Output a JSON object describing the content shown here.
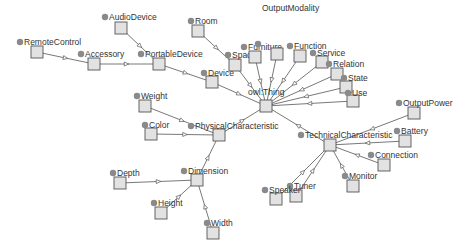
{
  "diagram": {
    "type": "class-hierarchy-graph",
    "colors": {
      "box_fill": "#e2e2e2",
      "box_stroke": "#555555",
      "dot": "#8a8a8a",
      "edge": "#555555",
      "label": "#333333"
    },
    "nodes": [
      {
        "id": "owlThing",
        "label": "owl:Thing",
        "x": 266,
        "y": 106,
        "lx": 248,
        "ly": 95,
        "dot": false
      },
      {
        "id": "RemoteControl",
        "label": "RemoteControl",
        "x": 37,
        "y": 52,
        "lx": 24,
        "ly": 45,
        "dot": true
      },
      {
        "id": "Accessory",
        "label": "Accessory",
        "x": 94,
        "y": 64,
        "lx": 85,
        "ly": 57,
        "dot": true
      },
      {
        "id": "AudioDevice",
        "label": "AudioDevice",
        "x": 121,
        "y": 28,
        "lx": 109,
        "ly": 20,
        "dot": true
      },
      {
        "id": "PortableDevice",
        "label": "PortableDevice",
        "x": 159,
        "y": 64,
        "lx": 145,
        "ly": 57,
        "dot": true
      },
      {
        "id": "Room",
        "label": "Room",
        "x": 198,
        "y": 31,
        "lx": 195,
        "ly": 24,
        "dot": true
      },
      {
        "id": "Device",
        "label": "Device",
        "x": 212,
        "y": 82,
        "lx": 208,
        "ly": 76,
        "dot": true
      },
      {
        "id": "Space",
        "label": "Space",
        "x": 235,
        "y": 65,
        "lx": 232,
        "ly": 58,
        "dot": true
      },
      {
        "id": "Furniture",
        "label": "Furniture",
        "x": 255,
        "y": 57,
        "lx": 248,
        "ly": 50,
        "dot": true
      },
      {
        "id": "OutputModality",
        "label": "OutputModality",
        "x": 277,
        "y": 54,
        "lx": 262,
        "ly": 11,
        "dot": true,
        "dx": 258,
        "dy": 44
      },
      {
        "id": "Function",
        "label": "Function",
        "x": 300,
        "y": 56,
        "lx": 294,
        "ly": 49,
        "dot": true
      },
      {
        "id": "Service",
        "label": "Service",
        "x": 322,
        "y": 62,
        "lx": 317,
        "ly": 56,
        "dot": true
      },
      {
        "id": "Relation",
        "label": "Relation",
        "x": 337,
        "y": 74,
        "lx": 333,
        "ly": 67,
        "dot": true
      },
      {
        "id": "State",
        "label": "State",
        "x": 346,
        "y": 87,
        "lx": 348,
        "ly": 81,
        "dot": true
      },
      {
        "id": "Use",
        "label": "Use",
        "x": 353,
        "y": 101,
        "lx": 352,
        "ly": 96,
        "dot": true
      },
      {
        "id": "TechnicalCharacteristic",
        "label": "TechnicalCharacteristic",
        "x": 330,
        "y": 145,
        "lx": 305,
        "ly": 138,
        "dot": true
      },
      {
        "id": "OutputPower",
        "label": "OutputPower",
        "x": 414,
        "y": 113,
        "lx": 403,
        "ly": 106,
        "dot": true
      },
      {
        "id": "Battery",
        "label": "Battery",
        "x": 405,
        "y": 141,
        "lx": 401,
        "ly": 134,
        "dot": true
      },
      {
        "id": "Connection",
        "label": "Connection",
        "x": 384,
        "y": 165,
        "lx": 375,
        "ly": 158,
        "dot": true
      },
      {
        "id": "Monitor",
        "label": "Monitor",
        "x": 353,
        "y": 186,
        "lx": 349,
        "ly": 179,
        "dot": true
      },
      {
        "id": "Tuner",
        "label": "Tuner",
        "x": 296,
        "y": 196,
        "lx": 294,
        "ly": 189,
        "dot": true
      },
      {
        "id": "Speaker",
        "label": "Speaker",
        "x": 276,
        "y": 199,
        "lx": 269,
        "ly": 193,
        "dot": true
      },
      {
        "id": "PhysicalCharacteristic",
        "label": "PhysicalCharacteristic",
        "x": 219,
        "y": 135,
        "lx": 195,
        "ly": 129,
        "dot": true
      },
      {
        "id": "Weight",
        "label": "Weight",
        "x": 145,
        "y": 106,
        "lx": 141,
        "ly": 99,
        "dot": true
      },
      {
        "id": "Color",
        "label": "Color",
        "x": 151,
        "y": 134,
        "lx": 149,
        "ly": 128,
        "dot": true
      },
      {
        "id": "Dimension",
        "label": "Dimension",
        "x": 197,
        "y": 180,
        "lx": 188,
        "ly": 174,
        "dot": true
      },
      {
        "id": "Depth",
        "label": "Depth",
        "x": 120,
        "y": 183,
        "lx": 117,
        "ly": 176,
        "dot": true
      },
      {
        "id": "Height",
        "label": "Height",
        "x": 161,
        "y": 213,
        "lx": 158,
        "ly": 206,
        "dot": true
      },
      {
        "id": "Width",
        "label": "Width",
        "x": 213,
        "y": 233,
        "lx": 211,
        "ly": 226,
        "dot": true
      }
    ],
    "edges": [
      [
        "RemoteControl",
        "Accessory"
      ],
      [
        "Accessory",
        "PortableDevice"
      ],
      [
        "AudioDevice",
        "PortableDevice"
      ],
      [
        "PortableDevice",
        "Device"
      ],
      [
        "Device",
        "owlThing"
      ],
      [
        "Room",
        "Space"
      ],
      [
        "Space",
        "owlThing"
      ],
      [
        "Furniture",
        "owlThing"
      ],
      [
        "OutputModality",
        "owlThing"
      ],
      [
        "Function",
        "owlThing"
      ],
      [
        "Service",
        "owlThing"
      ],
      [
        "Relation",
        "owlThing"
      ],
      [
        "State",
        "owlThing"
      ],
      [
        "Use",
        "owlThing"
      ],
      [
        "TechnicalCharacteristic",
        "owlThing"
      ],
      [
        "PhysicalCharacteristic",
        "owlThing"
      ],
      [
        "OutputPower",
        "TechnicalCharacteristic"
      ],
      [
        "Battery",
        "TechnicalCharacteristic"
      ],
      [
        "Connection",
        "TechnicalCharacteristic"
      ],
      [
        "Monitor",
        "TechnicalCharacteristic"
      ],
      [
        "Tuner",
        "TechnicalCharacteristic"
      ],
      [
        "Speaker",
        "TechnicalCharacteristic"
      ],
      [
        "Weight",
        "PhysicalCharacteristic"
      ],
      [
        "Color",
        "PhysicalCharacteristic"
      ],
      [
        "Dimension",
        "PhysicalCharacteristic"
      ],
      [
        "Depth",
        "Dimension"
      ],
      [
        "Height",
        "Dimension"
      ],
      [
        "Width",
        "Dimension"
      ]
    ]
  }
}
